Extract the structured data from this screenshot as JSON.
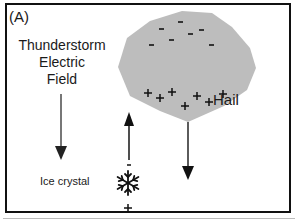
{
  "panel": {
    "label": "(A)"
  },
  "field": {
    "line1": "Thunderstorm",
    "line2": "Electric",
    "line3": "Field"
  },
  "hail": {
    "label": "Hail",
    "fill": "#bdbdbd",
    "top_charges": [
      "-",
      "-",
      "-",
      "-",
      "-",
      "-",
      "-"
    ],
    "bottom_charges": [
      "+",
      "+",
      "+",
      "+",
      "+",
      "+",
      "+"
    ]
  },
  "ice_crystal": {
    "label": "Ice crystal",
    "top_charge": "-",
    "bottom_charge": "+"
  },
  "arrows": [
    {
      "name": "electric-field-arrow",
      "direction": "down"
    },
    {
      "name": "ice-crystal-arrow",
      "direction": "up"
    },
    {
      "name": "hail-fall-arrow",
      "direction": "down"
    }
  ]
}
